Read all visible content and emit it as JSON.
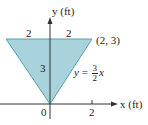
{
  "diagram": {
    "axes": {
      "y_label": "y (ft)",
      "x_label": "x (ft)",
      "origin_label": "0",
      "x_tick_label": "2"
    },
    "triangle": {
      "vertices": [
        [
          -2,
          3
        ],
        [
          2,
          3
        ],
        [
          0,
          0
        ]
      ],
      "fill_color": "#a9d3dc",
      "stroke_color": "#5a9fb0",
      "top_left_width_label": "2",
      "top_right_width_label": "2",
      "height_label": "3",
      "corner_label": "(2, 3)"
    },
    "equation": {
      "lhs": "y",
      "equals": "=",
      "numerator": "3",
      "denominator": "2",
      "variable": "x"
    }
  }
}
